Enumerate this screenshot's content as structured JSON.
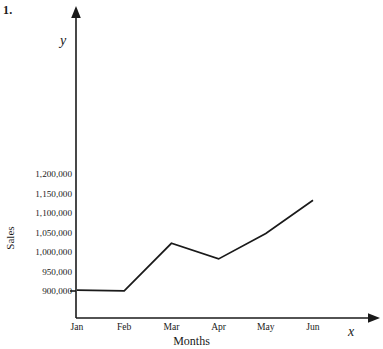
{
  "problem": {
    "number": "1."
  },
  "chart_data": {
    "type": "line",
    "title": "",
    "xlabel": "Months",
    "ylabel": "Sales",
    "x_axis_letter": "x",
    "y_axis_letter": "y",
    "categories": [
      "Jan",
      "Feb",
      "Mar",
      "Apr",
      "May",
      "Jun"
    ],
    "values": [
      905000,
      903000,
      1025000,
      985000,
      1050000,
      1135000
    ],
    "series": [
      {
        "name": "Sales",
        "values": [
          905000,
          903000,
          1025000,
          985000,
          1050000,
          1135000
        ]
      }
    ],
    "ytick_labels": [
      "1,200,000",
      "1,150,000",
      "1,100,000",
      "1,050,000",
      "1,000,000",
      "950,000",
      "900,000"
    ],
    "ytick_values": [
      1200000,
      1150000,
      1100000,
      1050000,
      1000000,
      950000,
      900000
    ],
    "ylim": [
      900000,
      1200000
    ],
    "grid": false,
    "legend": "none",
    "line_color": "#1a1a1a",
    "axis_color": "#1a1a1a",
    "background_color": "#ffffff"
  }
}
